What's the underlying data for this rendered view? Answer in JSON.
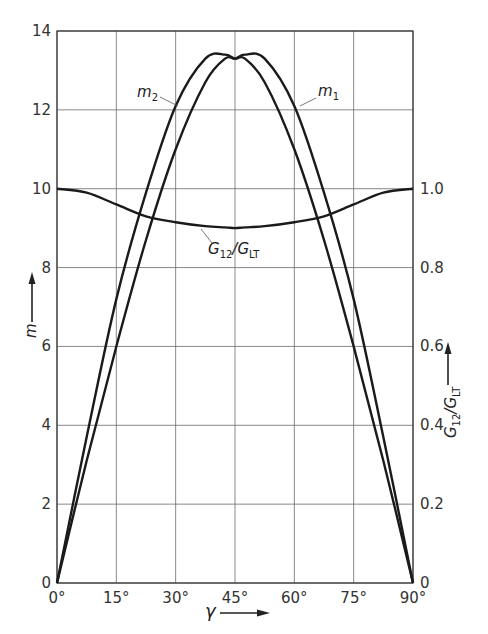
{
  "chart_data": {
    "type": "line",
    "title": "",
    "xlabel": "γ",
    "ylabel": "m",
    "y2label": "G12/GLT",
    "xlim": [
      0,
      90
    ],
    "ylim": [
      0,
      14
    ],
    "y2lim": [
      0,
      1.4
    ],
    "grid": true,
    "x_ticks": [
      0,
      15,
      30,
      45,
      60,
      75,
      90
    ],
    "x_tick_labels": [
      "0°",
      "15°",
      "30°",
      "45°",
      "60°",
      "75°",
      "90°"
    ],
    "y_ticks": [
      0,
      2,
      4,
      6,
      8,
      10,
      12,
      14
    ],
    "y_tick_labels": [
      "0",
      "2",
      "4",
      "6",
      "8",
      "10",
      "12",
      "14"
    ],
    "y2_ticks": [
      0,
      0.2,
      0.4,
      0.6,
      0.8,
      1.0
    ],
    "y2_tick_labels": [
      "0",
      "0.2",
      "0.4",
      "0.6",
      "0.8",
      "1.0"
    ],
    "x": [
      0,
      7.5,
      15,
      22.5,
      30,
      37.5,
      42.5,
      45,
      47.5,
      52.5,
      60,
      67.5,
      75,
      82.5,
      90
    ],
    "series": [
      {
        "name": "m1",
        "label": "m",
        "label_sub": "1",
        "axis": "left",
        "values": [
          0,
          3.1,
          6.0,
          8.7,
          11.0,
          12.7,
          13.3,
          13.3,
          13.4,
          13.3,
          12.1,
          9.9,
          7.2,
          3.7,
          0
        ]
      },
      {
        "name": "m2",
        "label": "m",
        "label_sub": "2",
        "axis": "left",
        "values": [
          0,
          3.7,
          7.2,
          9.9,
          12.1,
          13.3,
          13.4,
          13.3,
          13.3,
          12.7,
          11.0,
          8.7,
          6.0,
          3.1,
          0
        ]
      },
      {
        "name": "G12/GLT",
        "label": "G",
        "label_sub": "12",
        "label_mid": "/G",
        "label_sub2": "LT",
        "axis": "right",
        "values": [
          1.0,
          0.99,
          0.96,
          0.93,
          0.915,
          0.905,
          0.902,
          0.9,
          0.902,
          0.905,
          0.915,
          0.93,
          0.96,
          0.99,
          1.0
        ]
      }
    ]
  }
}
